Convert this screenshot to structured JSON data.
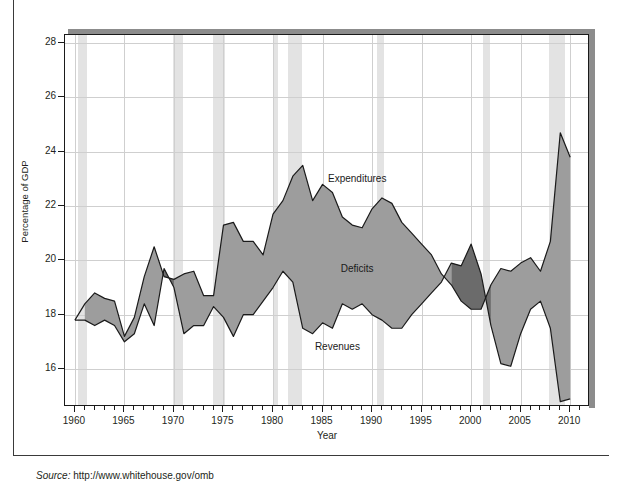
{
  "figure": {
    "source_prefix": "Source:",
    "source_url": "http://www.whitehouse.gov/omb"
  },
  "chart_data": {
    "type": "area",
    "title": "",
    "subtitle": "",
    "xlabel": "Year",
    "ylabel": "Percentage of GDP",
    "xlim": [
      1959,
      2012
    ],
    "ylim": [
      14.6,
      28.3
    ],
    "xticks": [
      1960,
      1965,
      1970,
      1975,
      1980,
      1985,
      1990,
      1995,
      2000,
      2005,
      2010
    ],
    "xtick_labels": [
      "1960",
      "1965",
      "1970",
      "1975",
      "1980",
      "1985",
      "1990",
      "1995",
      "2000",
      "2005",
      "2010"
    ],
    "xtick_minor_step": 1,
    "yticks": [
      16,
      18,
      20,
      22,
      24,
      26,
      28
    ],
    "ytick_labels": [
      "16",
      "18",
      "20",
      "22",
      "24",
      "26",
      "28"
    ],
    "grid": true,
    "legend_position": "inline-annotations",
    "annotations": [
      {
        "text": "Expenditures",
        "x": 1988.5,
        "y": 23.0
      },
      {
        "text": "Deficits",
        "x": 1988.5,
        "y": 19.7
      },
      {
        "text": "Revenues",
        "x": 1986.5,
        "y": 16.8
      }
    ],
    "colors": {
      "deficit_fill": "#9d9d9d",
      "surplus_fill": "#6b6b6b",
      "line": "#1a1a1a",
      "recession_band": "#e3e3e3",
      "gridline": "#cfcfcf",
      "axis": "#1a1a1a",
      "shadow": "#8c8c8c"
    },
    "x": [
      1960,
      1961,
      1962,
      1963,
      1964,
      1965,
      1966,
      1967,
      1968,
      1969,
      1970,
      1971,
      1972,
      1973,
      1974,
      1975,
      1976,
      1977,
      1978,
      1979,
      1980,
      1981,
      1982,
      1983,
      1984,
      1985,
      1986,
      1987,
      1988,
      1989,
      1990,
      1991,
      1992,
      1993,
      1994,
      1995,
      1996,
      1997,
      1998,
      1999,
      2000,
      2001,
      2002,
      2003,
      2004,
      2005,
      2006,
      2007,
      2008,
      2009,
      2010
    ],
    "series": [
      {
        "name": "Expenditures",
        "values": [
          17.8,
          18.4,
          18.8,
          18.6,
          18.5,
          17.2,
          17.9,
          19.4,
          20.5,
          19.4,
          19.3,
          19.5,
          19.6,
          18.7,
          18.7,
          21.3,
          21.4,
          20.7,
          20.7,
          20.2,
          21.7,
          22.2,
          23.1,
          23.5,
          22.2,
          22.8,
          22.5,
          21.6,
          21.3,
          21.2,
          21.9,
          22.3,
          22.1,
          21.4,
          21.0,
          20.6,
          20.2,
          19.5,
          19.1,
          18.5,
          18.2,
          18.2,
          19.1,
          19.7,
          19.6,
          19.9,
          20.1,
          19.6,
          20.7,
          24.7,
          23.8
        ]
      },
      {
        "name": "Revenues",
        "values": [
          17.8,
          17.8,
          17.6,
          17.8,
          17.6,
          17.0,
          17.3,
          18.4,
          17.6,
          19.7,
          19.0,
          17.3,
          17.6,
          17.6,
          18.3,
          17.9,
          17.2,
          18.0,
          18.0,
          18.5,
          19.0,
          19.6,
          19.2,
          17.5,
          17.3,
          17.7,
          17.5,
          18.4,
          18.2,
          18.4,
          18.0,
          17.8,
          17.5,
          17.5,
          18.0,
          18.4,
          18.8,
          19.2,
          19.9,
          19.8,
          20.6,
          19.5,
          17.6,
          16.2,
          16.1,
          17.3,
          18.2,
          18.5,
          17.5,
          14.8,
          14.9
        ]
      }
    ],
    "recession_bands": [
      {
        "start": 1960.3,
        "end": 1961.2
      },
      {
        "start": 1969.9,
        "end": 1970.9
      },
      {
        "start": 1973.9,
        "end": 1975.2
      },
      {
        "start": 1980.0,
        "end": 1980.5
      },
      {
        "start": 1981.5,
        "end": 1982.9
      },
      {
        "start": 1990.5,
        "end": 1991.2
      },
      {
        "start": 2001.2,
        "end": 2001.9
      },
      {
        "start": 2007.9,
        "end": 2009.5
      }
    ]
  }
}
